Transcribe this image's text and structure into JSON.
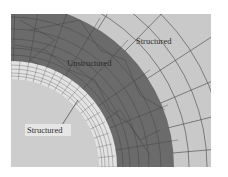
{
  "figure": {
    "labels": {
      "outer": "Structured",
      "middle": "Unstructured",
      "inner": "Structured"
    },
    "colors": {
      "background": "#ffffff",
      "inner_disk": "#cdcdcd",
      "inner_ring": "#e2e2e2",
      "unstructured_ring": "#6b6b6b",
      "outer_region": "#c9c9c9",
      "grid_line": "#3a3a3a",
      "label_bg_inner": "#e6e6e6"
    }
  }
}
